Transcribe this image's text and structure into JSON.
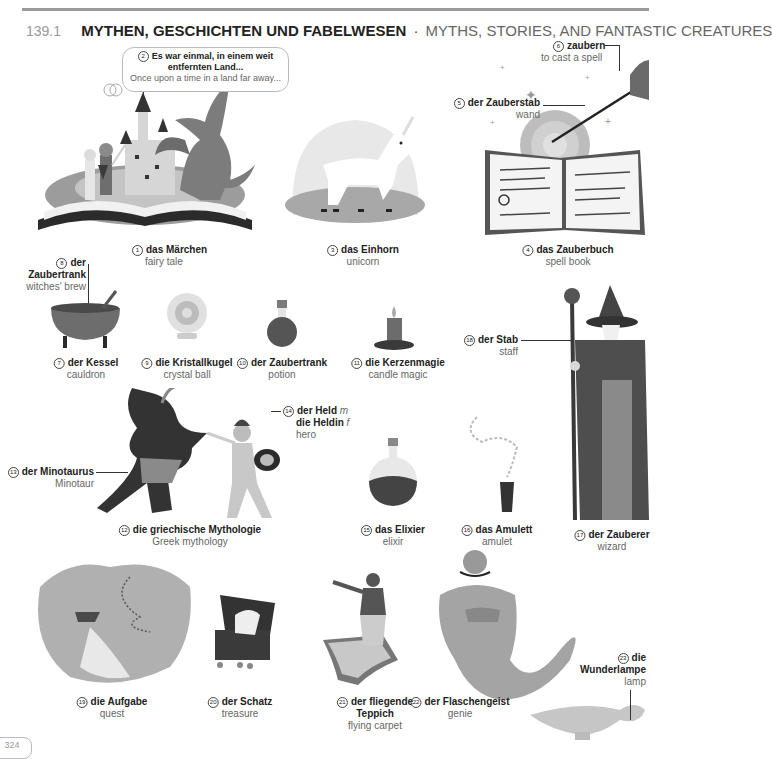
{
  "header": {
    "section_number": "139.1",
    "title_de": "MYTHEN, GESCHICHTEN UND FABELWESEN",
    "separator": "·",
    "title_en": "MYTHS, STORIES, AND FANTASTIC CREATURES"
  },
  "items": [
    {
      "n": "1",
      "de": "das Märchen",
      "en": "fairy tale"
    },
    {
      "n": "2",
      "de": "Es war einmal, in einem weit entfernten Land...",
      "de1": "Es war einmal, in einem weit",
      "de2": "entfernten Land...",
      "en": "Once upon a time in a land far away..."
    },
    {
      "n": "3",
      "de": "das Einhorn",
      "en": "unicorn"
    },
    {
      "n": "4",
      "de": "das Zauberbuch",
      "en": "spell book"
    },
    {
      "n": "5",
      "de": "der Zauberstab",
      "en": "wand"
    },
    {
      "n": "6",
      "de": "zaubern",
      "en": "to cast a spell"
    },
    {
      "n": "7",
      "de": "der Kessel",
      "en": "cauldron"
    },
    {
      "n": "8",
      "de1": "der",
      "de2": "Zaubertrank",
      "en": "witches' brew"
    },
    {
      "n": "9",
      "de": "die Kristallkugel",
      "en": "crystal ball"
    },
    {
      "n": "10",
      "de": "der Zaubertrank",
      "en": "potion"
    },
    {
      "n": "11",
      "de": "die Kerzenmagie",
      "en": "candle magic"
    },
    {
      "n": "12",
      "de": "die griechische Mythologie",
      "en": "Greek mythology"
    },
    {
      "n": "13",
      "de": "der Minotaurus",
      "en": "Minotaur"
    },
    {
      "n": "14",
      "de1": "der Held",
      "g1": "m",
      "de2": "die Heldin",
      "g2": "f",
      "en": "hero"
    },
    {
      "n": "15",
      "de": "das Elixier",
      "en": "elixir"
    },
    {
      "n": "16",
      "de": "das Amulett",
      "en": "amulet"
    },
    {
      "n": "17",
      "de": "der Zauberer",
      "en": "wizard"
    },
    {
      "n": "18",
      "de": "der Stab",
      "en": "staff"
    },
    {
      "n": "19",
      "de": "die Aufgabe",
      "en": "quest"
    },
    {
      "n": "20",
      "de": "der Schatz",
      "en": "treasure"
    },
    {
      "n": "21",
      "de1": "der fliegende",
      "de2": "Teppich",
      "en": "flying carpet"
    },
    {
      "n": "22",
      "de": "der Flaschengeist",
      "en": "genie"
    },
    {
      "n": "23",
      "de1": "die",
      "de2": "Wunderlampe",
      "en": "lamp"
    }
  ],
  "footer": {
    "page_number": "324"
  }
}
